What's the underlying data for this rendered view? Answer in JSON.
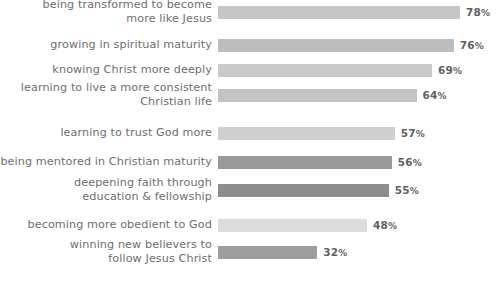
{
  "chart_data": {
    "type": "bar",
    "orientation": "horizontal",
    "title": "",
    "subtitle": "",
    "xlabel": "",
    "ylabel": "",
    "xlim": [
      0,
      100
    ],
    "grid": false,
    "legend": null,
    "value_suffix": "%",
    "categories": [
      "being transformed to become\nmore like Jesus",
      "growing in spiritual maturity",
      "knowing Christ more deeply",
      "learning to live a more consistent\nChristian life",
      "learning to trust God more",
      "being mentored in Christian maturity",
      "deepening faith through\neducation & fellowship",
      "becoming more obedient to God",
      "winning new believers to\nfollow Jesus Christ"
    ],
    "values": [
      78,
      76,
      69,
      64,
      57,
      56,
      55,
      48,
      32
    ],
    "value_labels": [
      "78%",
      "76%",
      "69%",
      "64%",
      "57%",
      "56%",
      "55%",
      "48%",
      "32%"
    ],
    "bar_colors": [
      "#c6c6c6",
      "#bdbdbd",
      "#c9c9c9",
      "#c3c3c3",
      "#cfcfcf",
      "#9a9a9a",
      "#8d8d8d",
      "#dcdcdc",
      "#9e9e9e"
    ],
    "label_color": "#6e6e6e",
    "value_color": "#5f5f5f",
    "background_color": "#ffffff"
  }
}
